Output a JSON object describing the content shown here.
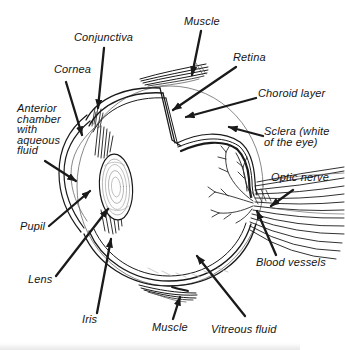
{
  "figure_title": "Eye anatomy cutaway diagram",
  "colors": {
    "ink": "#1a1a1a",
    "paper": "#ffffff"
  },
  "labels": {
    "muscle_top": {
      "text": "Muscle"
    },
    "conjunctiva": {
      "text": "Conjunctiva"
    },
    "cornea": {
      "text": "Cornea"
    },
    "retina": {
      "text": "Retina"
    },
    "choroid_layer": {
      "text": "Choroid layer"
    },
    "sclera": {
      "lines": [
        "Sclera (white",
        "of the eye)"
      ]
    },
    "anterior_chamber": {
      "lines": [
        "Anterior",
        "chamber",
        "with",
        "aqueous",
        "fluid"
      ]
    },
    "optic_nerve": {
      "text": "Optic nerve"
    },
    "pupil": {
      "text": "Pupil"
    },
    "lens": {
      "text": "Lens"
    },
    "iris": {
      "text": "Iris"
    },
    "muscle_bottom": {
      "text": "Muscle"
    },
    "vitreous_fluid": {
      "text": "Vitreous fluid"
    },
    "blood_vessels": {
      "text": "Blood vessels"
    }
  }
}
